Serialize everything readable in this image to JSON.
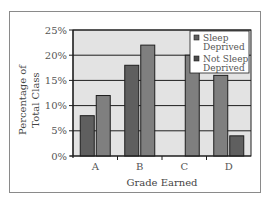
{
  "chart_data": {
    "type": "bar",
    "title": "",
    "xlabel": "Grade Earned",
    "ylabel": "Percentage of Total Class",
    "ylabel_lines": [
      "Percentage of",
      "Total Class"
    ],
    "categories": [
      "A",
      "B",
      "C",
      "D"
    ],
    "series": [
      {
        "name": "Sleep Deprived",
        "values": [
          8,
          18,
          0,
          4
        ],
        "color": "#5f5f5f"
      },
      {
        "name": "Not Sleep Deprived",
        "values": [
          12,
          22,
          20,
          16
        ],
        "color": "#7f7f7f"
      }
    ],
    "bar_order_note": "In group D the lighter bar appears left of the darker bar",
    "yticks": [
      "0%",
      "5%",
      "10%",
      "15%",
      "20%",
      "25%"
    ],
    "ylim": [
      0,
      25
    ],
    "grid": true,
    "legend_position": "upper-right-inside",
    "legend": [
      {
        "label_lines": [
          "Sleep",
          "Deprived"
        ],
        "color": "#5f5f5f"
      },
      {
        "label_lines": [
          "Not Sleep",
          "Deprived"
        ],
        "color": "#4a4a4a"
      }
    ],
    "colors": {
      "plot_bg": "#e3e3e3",
      "grid": "#1e1e1e",
      "frame": "#8a8a8a"
    }
  }
}
